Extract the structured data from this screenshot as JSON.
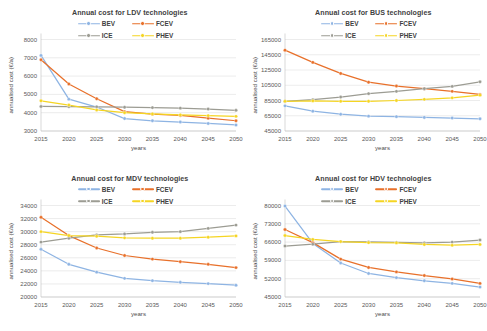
{
  "figure": {
    "background": "#ffffff",
    "series_colors": {
      "BEV": "#8eb4e3",
      "FCEV": "#e8702a",
      "ICE": "#9c9c93",
      "PHEV": "#f5d523"
    },
    "legend_order": [
      "BEV",
      "FCEV",
      "ICE",
      "PHEV"
    ],
    "common_xlabel": "years",
    "common_ylabel": "annualised cost (€/a)",
    "x_ticks": [
      "2015",
      "2020",
      "2025",
      "2030",
      "2035",
      "2040",
      "2045",
      "2050"
    ]
  },
  "panels": [
    {
      "id": "ldv",
      "title": "Annual cost for LDV technologies",
      "legend": [
        {
          "name": "BEV",
          "color": "#8eb4e3"
        },
        {
          "name": "FCEV",
          "color": "#e8702a"
        },
        {
          "name": "ICE",
          "color": "#9c9c93"
        },
        {
          "name": "PHEV",
          "color": "#f5d523"
        }
      ],
      "ylabel": "annualised cost (€/a)",
      "xlabel": "years",
      "y_ticks": [
        "3000",
        "4000",
        "5000",
        "6000",
        "7000",
        "8000"
      ]
    },
    {
      "id": "bus",
      "title": "Annual cost for BUS technologies",
      "legend": [
        {
          "name": "BEV",
          "color": "#8eb4e3"
        },
        {
          "name": "FCEV",
          "color": "#e8702a"
        },
        {
          "name": "ICE",
          "color": "#9c9c93"
        },
        {
          "name": "PHEV",
          "color": "#f5d523"
        }
      ],
      "ylabel": "annualised cost (€/a)",
      "xlabel": "years",
      "y_ticks": [
        "45000",
        "65000",
        "85000",
        "105000",
        "125000",
        "145000",
        "165000"
      ]
    },
    {
      "id": "mdv",
      "title": "Annual cost for MDV technologies",
      "legend": [
        {
          "name": "BEV",
          "color": "#8eb4e3"
        },
        {
          "name": "FCEV",
          "color": "#e8702a"
        },
        {
          "name": "ICE",
          "color": "#9c9c93"
        },
        {
          "name": "PHEV",
          "color": "#f5d523"
        }
      ],
      "ylabel": "annualised cost (€/a)",
      "xlabel": "years",
      "y_ticks": [
        "20000",
        "22000",
        "24000",
        "26000",
        "28000",
        "30000",
        "32000",
        "34000"
      ]
    },
    {
      "id": "hdv",
      "title": "Annual cost for HDV technologies",
      "legend": [
        {
          "name": "BEV",
          "color": "#8eb4e3"
        },
        {
          "name": "FCEV",
          "color": "#e8702a"
        },
        {
          "name": "ICE",
          "color": "#9c9c93"
        },
        {
          "name": "PHEV",
          "color": "#f5d523"
        }
      ],
      "ylabel": "annualised cost (€/a)",
      "xlabel": "years",
      "y_ticks": [
        "45000",
        "52000",
        "59000",
        "66000",
        "73000",
        "80000"
      ]
    }
  ],
  "chart_data": [
    {
      "type": "line",
      "id": "ldv",
      "title": "Annual cost for LDV technologies",
      "xlabel": "years",
      "ylabel": "annualised cost (€/a)",
      "x": [
        2015,
        2020,
        2025,
        2030,
        2035,
        2040,
        2045,
        2050
      ],
      "ylim": [
        3000,
        8000
      ],
      "ytick_step": 1000,
      "grid": false,
      "legend_position": "top-center",
      "series": [
        {
          "name": "BEV",
          "color": "#8eb4e3",
          "values": [
            7130,
            4740,
            4310,
            3680,
            3560,
            3490,
            3410,
            3330
          ]
        },
        {
          "name": "FCEV",
          "color": "#e8702a",
          "values": [
            6890,
            5570,
            4760,
            4060,
            3920,
            3850,
            3700,
            3560
          ]
        },
        {
          "name": "ICE",
          "color": "#9c9c93",
          "values": [
            4340,
            4330,
            4320,
            4300,
            4280,
            4250,
            4200,
            4130
          ]
        },
        {
          "name": "PHEV",
          "color": "#f5d523",
          "values": [
            4650,
            4420,
            4150,
            4000,
            3930,
            3880,
            3840,
            3800
          ]
        }
      ]
    },
    {
      "type": "line",
      "id": "bus",
      "title": "Annual cost for BUS technologies",
      "xlabel": "years",
      "ylabel": "annualised cost (€/a)",
      "x": [
        2015,
        2020,
        2025,
        2030,
        2035,
        2040,
        2045,
        2050
      ],
      "ylim": [
        45000,
        165000
      ],
      "ytick_step": 20000,
      "grid": false,
      "legend_position": "top-center",
      "series": [
        {
          "name": "BEV",
          "color": "#8eb4e3",
          "values": [
            78000,
            71000,
            67000,
            64500,
            63800,
            62800,
            62000,
            61000
          ]
        },
        {
          "name": "FCEV",
          "color": "#e8702a",
          "values": [
            151000,
            135000,
            120500,
            109000,
            104000,
            100500,
            97000,
            93000
          ]
        },
        {
          "name": "ICE",
          "color": "#9c9c93",
          "values": [
            84000,
            86000,
            89500,
            94000,
            97000,
            100500,
            103500,
            109500
          ]
        },
        {
          "name": "PHEV",
          "color": "#f5d523",
          "values": [
            84000,
            84500,
            84000,
            84000,
            85000,
            86500,
            88500,
            92000
          ]
        }
      ]
    },
    {
      "type": "line",
      "id": "mdv",
      "title": "Annual cost for MDV technologies",
      "xlabel": "years",
      "ylabel": "annualised cost (€/a)",
      "x": [
        2015,
        2020,
        2025,
        2030,
        2035,
        2040,
        2045,
        2050
      ],
      "ylim": [
        20000,
        34000
      ],
      "ytick_step": 2000,
      "grid": false,
      "legend_position": "top-center",
      "series": [
        {
          "name": "BEV",
          "color": "#8eb4e3",
          "values": [
            27300,
            25000,
            23800,
            22850,
            22500,
            22250,
            22050,
            21800
          ]
        },
        {
          "name": "FCEV",
          "color": "#e8702a",
          "values": [
            32200,
            29400,
            27500,
            26350,
            25800,
            25400,
            25000,
            24500
          ]
        },
        {
          "name": "ICE",
          "color": "#9c9c93",
          "values": [
            28400,
            29000,
            29500,
            29650,
            29900,
            30000,
            30500,
            31000
          ]
        },
        {
          "name": "PHEV",
          "color": "#f5d523",
          "values": [
            30000,
            29400,
            29300,
            29050,
            29000,
            29000,
            29150,
            29350
          ]
        }
      ]
    },
    {
      "type": "line",
      "id": "hdv",
      "title": "Annual cost for HDV technologies",
      "xlabel": "years",
      "ylabel": "annualised cost (€/a)",
      "x": [
        2015,
        2020,
        2025,
        2030,
        2035,
        2040,
        2045,
        2050
      ],
      "ylim": [
        45000,
        80000
      ],
      "ytick_step": 7000,
      "grid": false,
      "legend_position": "top-center",
      "series": [
        {
          "name": "BEV",
          "color": "#8eb4e3",
          "values": [
            79800,
            65500,
            58000,
            54000,
            52400,
            51200,
            50200,
            48800
          ]
        },
        {
          "name": "FCEV",
          "color": "#e8702a",
          "values": [
            70800,
            65800,
            59500,
            56300,
            54600,
            53200,
            51900,
            50200
          ]
        },
        {
          "name": "ICE",
          "color": "#9c9c93",
          "values": [
            64500,
            65200,
            66200,
            66100,
            65900,
            65700,
            66000,
            66800
          ]
        },
        {
          "name": "PHEV",
          "color": "#f5d523",
          "values": [
            68500,
            67000,
            66200,
            65800,
            65700,
            65100,
            64800,
            65100
          ]
        }
      ]
    }
  ]
}
